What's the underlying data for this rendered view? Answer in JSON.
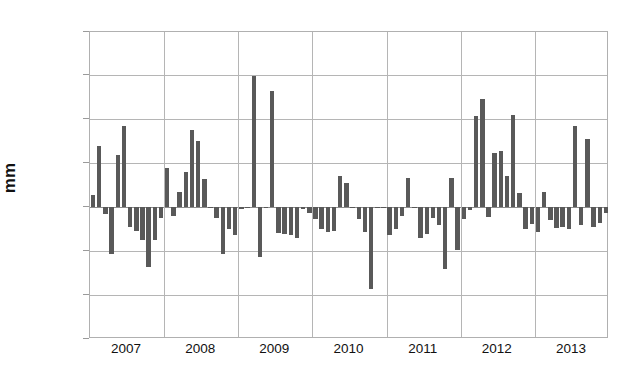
{
  "chart_data": {
    "type": "bar",
    "title": "",
    "xlabel": "",
    "ylabel": "mm",
    "ylim": [
      -150,
      200
    ],
    "ytick_values": [
      200,
      150,
      100,
      50,
      0,
      -50,
      -100,
      -150
    ],
    "ytick_labels": [
      "200",
      "150",
      "100",
      "50",
      "0",
      "-50",
      "-100",
      "-150"
    ],
    "xtick_labels": [
      "2007",
      "2008",
      "2009",
      "2010",
      "2011",
      "2012",
      "2013"
    ],
    "grid": true,
    "legend": "none",
    "bar_color": "#595959",
    "grid_color": "#b5b5b5",
    "frame_color": "#b0b0b0",
    "categories": [
      "2007-01",
      "2007-02",
      "2007-03",
      "2007-04",
      "2007-05",
      "2007-06",
      "2007-07",
      "2007-08",
      "2007-09",
      "2007-10",
      "2007-11",
      "2007-12",
      "2008-01",
      "2008-02",
      "2008-03",
      "2008-04",
      "2008-05",
      "2008-06",
      "2008-07",
      "2008-08",
      "2008-09",
      "2008-10",
      "2008-11",
      "2008-12",
      "2009-01",
      "2009-02",
      "2009-03",
      "2009-04",
      "2009-05",
      "2009-06",
      "2009-07",
      "2009-08",
      "2009-09",
      "2009-10",
      "2009-11",
      "2009-12",
      "2010-01",
      "2010-02",
      "2010-03",
      "2010-04",
      "2010-05",
      "2010-06",
      "2010-07",
      "2010-08",
      "2010-09",
      "2010-10",
      "2010-11",
      "2010-12",
      "2011-01",
      "2011-02",
      "2011-03",
      "2011-04",
      "2011-05",
      "2011-06",
      "2011-07",
      "2011-08",
      "2011-09",
      "2011-10",
      "2011-11",
      "2011-12",
      "2012-01",
      "2012-02",
      "2012-03",
      "2012-04",
      "2012-05",
      "2012-06",
      "2012-07",
      "2012-08",
      "2012-09",
      "2012-10",
      "2012-11",
      "2012-12",
      "2013-01",
      "2013-02",
      "2013-03",
      "2013-04",
      "2013-05",
      "2013-06",
      "2013-07",
      "2013-08",
      "2013-09",
      "2013-10",
      "2013-11",
      "2013-12"
    ],
    "values": [
      14,
      70,
      -8,
      -53,
      60,
      93,
      -22,
      -27,
      -37,
      -68,
      -37,
      -12,
      45,
      -10,
      18,
      40,
      88,
      76,
      32,
      -1,
      -12,
      -53,
      -25,
      -32,
      -2,
      0,
      150,
      -57,
      -1,
      133,
      -29,
      -30,
      -32,
      -35,
      -2,
      -6,
      -13,
      -25,
      -28,
      -27,
      36,
      28,
      -1,
      -13,
      -28,
      -93,
      -1,
      1,
      -31,
      -25,
      -10,
      33,
      -1,
      -35,
      -30,
      -12,
      -20,
      -70,
      33,
      -48,
      -13,
      -3,
      104,
      124,
      -11,
      62,
      64,
      36,
      105,
      16,
      -25,
      -19,
      -28,
      18,
      -14,
      -23,
      -22,
      -25,
      93,
      -20,
      78,
      -22,
      -18,
      -6
    ]
  },
  "footer": {
    "watermark": ""
  }
}
